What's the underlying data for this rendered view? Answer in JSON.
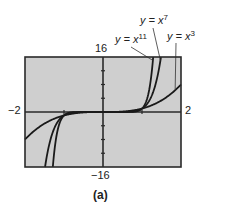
{
  "chart_data": {
    "type": "line",
    "title": "",
    "caption": "(a)",
    "xlabel": "",
    "ylabel": "",
    "xlim": [
      -2,
      2
    ],
    "ylim": [
      -16,
      16
    ],
    "x_tick_step": 1,
    "y_tick_step": 4,
    "axis_labels": {
      "xmin": "−2",
      "xmax": "2",
      "ymin": "−16",
      "ymax": "16"
    },
    "grid": false,
    "background": "#cfcfcf",
    "series": [
      {
        "name": "y = x^3",
        "label_base": "y = x",
        "exponent": 3,
        "function": "x^3",
        "values": [
          [
            -2,
            -8
          ],
          [
            -1.5,
            -3.375
          ],
          [
            -1,
            -1
          ],
          [
            -0.5,
            -0.125
          ],
          [
            0,
            0
          ],
          [
            0.5,
            0.125
          ],
          [
            1,
            1
          ],
          [
            1.5,
            3.375
          ],
          [
            2,
            8
          ]
        ]
      },
      {
        "name": "y = x^7",
        "label_base": "y = x",
        "exponent": 7,
        "function": "x^7",
        "values": [
          [
            -1.486,
            -16
          ],
          [
            -1.25,
            -4.77
          ],
          [
            -1,
            -1
          ],
          [
            -0.5,
            -0.008
          ],
          [
            0,
            0
          ],
          [
            0.5,
            0.008
          ],
          [
            1,
            1
          ],
          [
            1.25,
            4.77
          ],
          [
            1.486,
            16
          ]
        ]
      },
      {
        "name": "y = x^11",
        "label_base": "y = x",
        "exponent": 11,
        "function": "x^11",
        "values": [
          [
            -1.287,
            -16
          ],
          [
            -1.15,
            -4.65
          ],
          [
            -1,
            -1
          ],
          [
            -0.5,
            -0.0005
          ],
          [
            0,
            0
          ],
          [
            0.5,
            0.0005
          ],
          [
            1,
            1
          ],
          [
            1.15,
            4.65
          ],
          [
            1.287,
            16
          ]
        ]
      }
    ]
  },
  "colors": {
    "plot_bg": "#cfcfcf",
    "frame": "#2a2a2a",
    "curve": "#1a1a1a"
  }
}
